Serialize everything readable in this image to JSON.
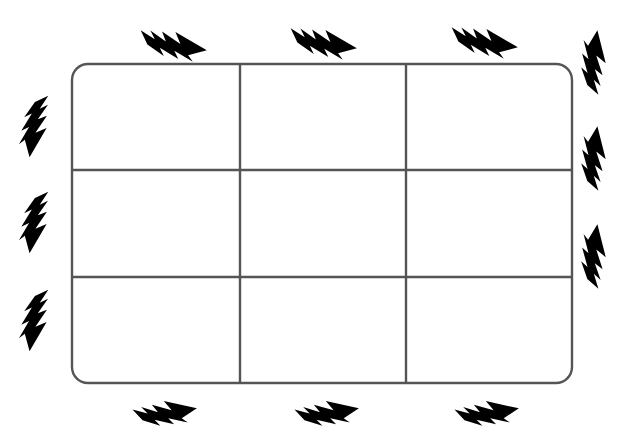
{
  "canvas": {
    "width": 642,
    "height": 443,
    "background": "#ffffff"
  },
  "colors": {
    "grid_stroke": "#555555",
    "grid_fill": "#ffffff",
    "bolt_fill": "#000000"
  },
  "grid": {
    "name": "nine-cell-rounded-grid",
    "rows": 3,
    "columns": 3,
    "cell_count": 9,
    "x": 72,
    "y": 64,
    "width": 500,
    "height": 319,
    "corner_radius": 16,
    "stroke_width": 2.4,
    "vertical_dividers_x": [
      240,
      406
    ],
    "horizontal_dividers_y": [
      170,
      277
    ],
    "cells": [
      {
        "id": "cell-r1-c1",
        "row": 1,
        "col": 1,
        "label": ""
      },
      {
        "id": "cell-r1-c2",
        "row": 1,
        "col": 2,
        "label": ""
      },
      {
        "id": "cell-r1-c3",
        "row": 1,
        "col": 3,
        "label": ""
      },
      {
        "id": "cell-r2-c1",
        "row": 2,
        "col": 1,
        "label": ""
      },
      {
        "id": "cell-r2-c2",
        "row": 2,
        "col": 2,
        "label": ""
      },
      {
        "id": "cell-r2-c3",
        "row": 2,
        "col": 3,
        "label": ""
      },
      {
        "id": "cell-r3-c1",
        "row": 3,
        "col": 1,
        "label": ""
      },
      {
        "id": "cell-r3-c2",
        "row": 3,
        "col": 2,
        "label": ""
      },
      {
        "id": "cell-r3-c3",
        "row": 3,
        "col": 3,
        "label": ""
      }
    ]
  },
  "bolts": {
    "icon_name": "lightning-bolt-icon",
    "count": 12,
    "items": [
      {
        "id": "bolt-top-1",
        "side": "top",
        "index": 1,
        "x": 138,
        "y": 22,
        "rotate": 0,
        "scale": 1.0
      },
      {
        "id": "bolt-top-2",
        "side": "top",
        "index": 2,
        "x": 290,
        "y": 20,
        "rotate": 0,
        "scale": 1.0
      },
      {
        "id": "bolt-top-3",
        "side": "top",
        "index": 3,
        "x": 450,
        "y": 20,
        "rotate": 0,
        "scale": 1.0
      },
      {
        "id": "bolt-left-1",
        "side": "left",
        "index": 1,
        "x": 30,
        "y": 94,
        "rotate": 90,
        "scale": 1.0
      },
      {
        "id": "bolt-left-2",
        "side": "left",
        "index": 2,
        "x": 30,
        "y": 190,
        "rotate": 90,
        "scale": 1.0
      },
      {
        "id": "bolt-left-3",
        "side": "left",
        "index": 3,
        "x": 30,
        "y": 288,
        "rotate": 90,
        "scale": 1.0
      },
      {
        "id": "bolt-right-1",
        "side": "right",
        "index": 1,
        "x": 573,
        "y": 94,
        "rotate": 90,
        "scale": 1.0
      },
      {
        "id": "bolt-right-2",
        "side": "right",
        "index": 2,
        "x": 573,
        "y": 190,
        "rotate": 90,
        "scale": 1.0
      },
      {
        "id": "bolt-right-3",
        "side": "right",
        "index": 3,
        "x": 573,
        "y": 288,
        "rotate": 90,
        "scale": 1.0
      },
      {
        "id": "bolt-bottom-1",
        "side": "bottom",
        "index": 1,
        "x": 128,
        "y": 392,
        "rotate": 180,
        "scale": 1.0
      },
      {
        "id": "bolt-bottom-2",
        "side": "bottom",
        "index": 2,
        "x": 290,
        "y": 392,
        "rotate": 180,
        "scale": 1.0
      },
      {
        "id": "bolt-bottom-3",
        "side": "bottom",
        "index": 3,
        "x": 450,
        "y": 392,
        "rotate": 180,
        "scale": 1.0
      }
    ]
  }
}
